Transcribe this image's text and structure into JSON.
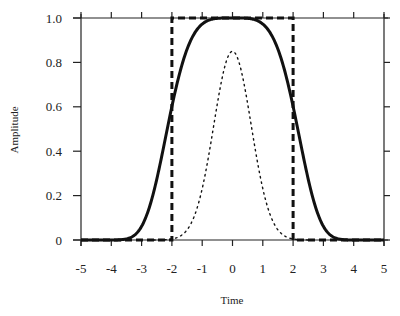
{
  "chart_data": {
    "type": "line",
    "title": "",
    "xlabel": "Time",
    "ylabel": "Amplitude",
    "xlim": [
      -5,
      5
    ],
    "ylim": [
      0,
      1.0
    ],
    "grid": false,
    "legend": null,
    "x_ticks": [
      -5,
      -4,
      -3,
      -2,
      -1,
      0,
      1,
      2,
      3,
      4,
      5
    ],
    "x_tick_labels": [
      "-5",
      "-4",
      "-3",
      "-2",
      "-1",
      "0",
      "1",
      "2",
      "3",
      "4",
      "5"
    ],
    "y_ticks": [
      0,
      0.2,
      0.4,
      0.6,
      0.8,
      1.0
    ],
    "y_tick_labels": [
      "0",
      "0.2",
      "0.4",
      "0.6",
      "0.8",
      "1.0"
    ],
    "series": [
      {
        "name": "rectangular window",
        "style": "dashed",
        "x": [
          -5,
          -2,
          -2,
          2,
          2,
          5
        ],
        "y": [
          0,
          0,
          1.0,
          1.0,
          0,
          0
        ]
      },
      {
        "name": "smooth window",
        "style": "solid-thick",
        "x": [
          -5,
          -4,
          -3.5,
          -3,
          -2.5,
          -2,
          -1.5,
          -1,
          -0.5,
          0,
          0.5,
          1,
          1.5,
          2,
          2.5,
          3,
          3.5,
          4,
          5
        ],
        "y": [
          0,
          0,
          0.01,
          0.08,
          0.25,
          0.55,
          0.82,
          0.96,
          1.0,
          1.0,
          1.0,
          0.96,
          0.82,
          0.55,
          0.25,
          0.08,
          0.01,
          0,
          0
        ]
      },
      {
        "name": "gaussian pulse",
        "style": "dotted",
        "x": [
          -2.5,
          -2,
          -1.5,
          -1,
          -0.5,
          0,
          0.5,
          1,
          1.5,
          2,
          2.5
        ],
        "y": [
          0,
          0.01,
          0.06,
          0.28,
          0.62,
          0.85,
          0.62,
          0.28,
          0.06,
          0.01,
          0
        ]
      }
    ]
  },
  "colors": {
    "line": "#111111",
    "axis": "#222222",
    "background": "#ffffff"
  }
}
